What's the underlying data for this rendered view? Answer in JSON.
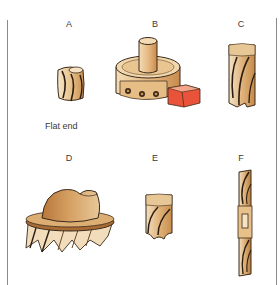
{
  "figure": {
    "panels": [
      {
        "id": "A",
        "label": "A",
        "caption": "Flat end",
        "icon": "flat-end-mill-icon"
      },
      {
        "id": "B",
        "label": "B",
        "caption": "",
        "icon": "indexable-face-mill-icon"
      },
      {
        "id": "C",
        "label": "C",
        "caption": "",
        "icon": "helical-end-mill-icon"
      },
      {
        "id": "D",
        "label": "D",
        "caption": "",
        "icon": "shell-face-mill-icon"
      },
      {
        "id": "E",
        "label": "E",
        "caption": "",
        "icon": "ball-end-mill-icon"
      },
      {
        "id": "F",
        "label": "F",
        "caption": "",
        "icon": "double-end-mill-icon"
      }
    ]
  },
  "colors": {
    "tan_light": "#f2dcb8",
    "tan": "#d9a86a",
    "tan_dark": "#b77a3e",
    "brown": "#a66a32",
    "outline": "#3b2a1a",
    "insert_red": "#e03a1e",
    "rule": "#8a8a8a"
  }
}
